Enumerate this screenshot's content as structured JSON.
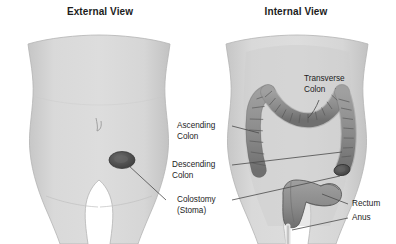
{
  "figure": {
    "panels": [
      {
        "id": "external",
        "title": "External View"
      },
      {
        "id": "internal",
        "title": "Internal View"
      }
    ],
    "labels": [
      {
        "id": "transverse-colon",
        "line1": "Transverse",
        "line2": "Colon"
      },
      {
        "id": "ascending-colon",
        "line1": "Ascending",
        "line2": "Colon"
      },
      {
        "id": "descending-colon",
        "line1": "Descending",
        "line2": "Colon"
      },
      {
        "id": "colostomy-stoma",
        "line1": "Colostomy",
        "line2": "(Stoma)"
      },
      {
        "id": "rectum",
        "line1": "Rectum",
        "line2": ""
      },
      {
        "id": "anus",
        "line1": "Anus",
        "line2": ""
      }
    ],
    "colors": {
      "background": "#ffffff",
      "body_fill": "#d5d5d5",
      "body_outline": "#b0b0b0",
      "colon_fill": "#8d8d8d",
      "colon_outline": "#5d5d5d",
      "stoma_dark": "#4f4f4f",
      "leader_line": "#4a4a4a",
      "text": "#1c1c1c"
    }
  }
}
